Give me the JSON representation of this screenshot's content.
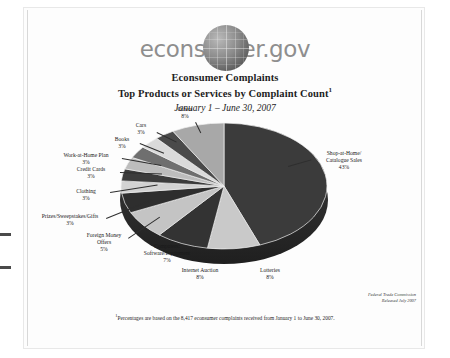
{
  "document": {
    "logo_text": "econsumer",
    "logo_suffix": ".gov",
    "logo_globe": "globe-icon",
    "title_line1": "Econsumer Complaints",
    "title_line2": "Top Products or Services by Complaint Count",
    "title_footnote_marker": "1",
    "subtitle": "January 1 – June 30, 2007",
    "footnote_marker": "1",
    "footnote": "Percentages are based on the 8,417 econsumer complaints received from January 1 to June 30, 2007.",
    "source_line1": "Federal Trade Commission",
    "source_line2": "Released July 2007"
  },
  "chart_data": {
    "type": "pie",
    "subtitle": "January 1 – June 30, 2007",
    "total_complaints": "8,417",
    "value_suffix": "%",
    "legend": "none",
    "categories": [
      "Shop-at-Home/ Catalogue Sales",
      "Lotteries",
      "Internet Auction",
      "Computers: Software/Equipment",
      "Foreign Money Offers",
      "Prizes/Sweepstakes/Gifts",
      "Clothing",
      "Credit Cards",
      "Work-at-Home Plan",
      "Books",
      "Cars",
      "Others"
    ],
    "values": [
      43,
      8,
      8,
      7,
      5,
      3,
      3,
      3,
      3,
      3,
      3,
      8
    ],
    "slices": [
      {
        "label_line1": "Shop-at-Home/",
        "label_line2": "Catalogue Sales",
        "pct": "43%",
        "value": 43,
        "color": "#3b3b3b"
      },
      {
        "label_line1": "Lotteries",
        "label_line2": "",
        "pct": "8%",
        "value": 8,
        "color": "#c9c9c9"
      },
      {
        "label_line1": "Internet Auction",
        "label_line2": "",
        "pct": "8%",
        "value": 8,
        "color": "#333333"
      },
      {
        "label_line1": "Computers:",
        "label_line2": "Software/Equipment",
        "pct": "7%",
        "value": 7,
        "color": "#c4c4c4"
      },
      {
        "label_line1": "Foreign Money",
        "label_line2": "Offers",
        "pct": "5%",
        "value": 5,
        "color": "#2e2e2e"
      },
      {
        "label_line1": "Prizes/Sweepstakes/Gifts",
        "label_line2": "",
        "pct": "3%",
        "value": 3,
        "color": "#d2d2d2"
      },
      {
        "label_line1": "Clothing",
        "label_line2": "",
        "pct": "3%",
        "value": 3,
        "color": "#3c3c3c"
      },
      {
        "label_line1": "Credit Cards",
        "label_line2": "",
        "pct": "3%",
        "value": 3,
        "color": "#bdbdbd"
      },
      {
        "label_line1": "Work-at-Home Plan",
        "label_line2": "",
        "pct": "3%",
        "value": 3,
        "color": "#6f6f6f"
      },
      {
        "label_line1": "Books",
        "label_line2": "",
        "pct": "3%",
        "value": 3,
        "color": "#dadada"
      },
      {
        "label_line1": "Cars",
        "label_line2": "",
        "pct": "3%",
        "value": 3,
        "color": "#4a4a4a"
      },
      {
        "label_line1": "Others",
        "label_line2": "",
        "pct": "8%",
        "value": 8,
        "color": "#a8a8a8"
      }
    ]
  }
}
